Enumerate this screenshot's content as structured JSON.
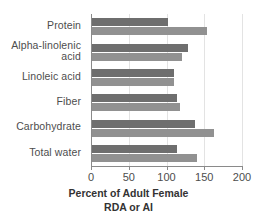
{
  "chart_data": {
    "type": "bar",
    "orientation": "horizontal",
    "title": "",
    "xlabel": "Percent of Adult Female RDA or AI",
    "ylabel": "",
    "xlim": [
      0,
      200
    ],
    "xticks": [
      0,
      50,
      100,
      150,
      200
    ],
    "grid": true,
    "legend": "none",
    "categories": [
      "Protein",
      "Alpha-linolenic\nacid",
      "Linoleic acid",
      "Fiber",
      "Carbohydrate",
      "Total water"
    ],
    "series": [
      {
        "name": "upper",
        "color": "#6e6e6e",
        "values": [
          100,
          127,
          108,
          112,
          136,
          112
        ]
      },
      {
        "name": "lower",
        "color": "#919191",
        "values": [
          152,
          119,
          108,
          117,
          161,
          139
        ]
      }
    ]
  },
  "axis": {
    "x_title_line1": "Percent of Adult Female",
    "x_title_line2": "RDA or AI",
    "tick_labels": [
      "0",
      "50",
      "100",
      "150",
      "200"
    ]
  },
  "colors": {
    "upper_bar": "#6e6e6e",
    "lower_bar": "#919191",
    "axis": "#8a8a8a",
    "gridline": "#e3e3e3",
    "text": "#4d4d4d",
    "background": "#ffffff"
  }
}
